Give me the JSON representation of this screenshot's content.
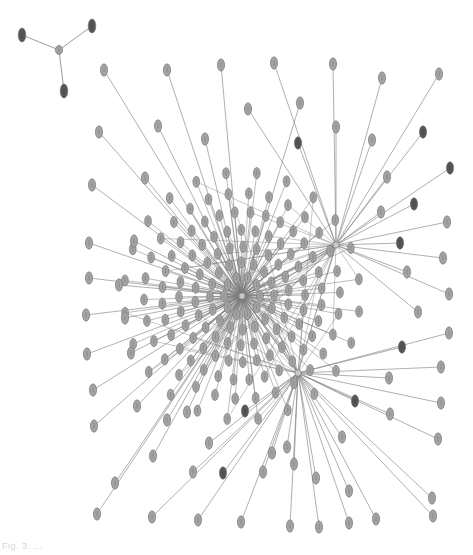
{
  "figure": {
    "type": "network-graph",
    "caption": "Fig. 3.  ..."
  },
  "colors": {
    "background": "#ffffff",
    "edge": "#7a7a7a",
    "node_light": "#a3a3a3",
    "node_dark": "#555555",
    "node_stroke": "#6e6e6e",
    "hub": "#c8c8c8"
  },
  "hubs": [
    {
      "id": "hub-main",
      "x": 242,
      "y": 296
    },
    {
      "id": "hub-right",
      "x": 336,
      "y": 245
    },
    {
      "id": "hub-lower",
      "x": 298,
      "y": 373
    }
  ],
  "small_component": {
    "center": {
      "x": 59,
      "y": 50
    },
    "leaves": [
      {
        "x": 22,
        "y": 35,
        "dark": true
      },
      {
        "x": 92,
        "y": 26,
        "dark": true
      },
      {
        "x": 64,
        "y": 91,
        "dark": true
      }
    ]
  },
  "outer_nodes": [
    {
      "x": 104,
      "y": 70,
      "hub": 0
    },
    {
      "x": 167,
      "y": 70,
      "hub": 0
    },
    {
      "x": 221,
      "y": 65,
      "hub": 0
    },
    {
      "x": 274,
      "y": 63,
      "hub": 1
    },
    {
      "x": 333,
      "y": 64,
      "hub": 1
    },
    {
      "x": 439,
      "y": 74,
      "hub": 1
    },
    {
      "x": 382,
      "y": 78,
      "hub": 1
    },
    {
      "x": 248,
      "y": 109,
      "hub": 1
    },
    {
      "x": 300,
      "y": 103,
      "hub": 0
    },
    {
      "x": 336,
      "y": 127,
      "hub": 1
    },
    {
      "x": 298,
      "y": 143,
      "hub": 1,
      "dark": true
    },
    {
      "x": 372,
      "y": 140,
      "hub": 1
    },
    {
      "x": 423,
      "y": 132,
      "hub": 1,
      "dark": true
    },
    {
      "x": 99,
      "y": 132,
      "hub": 0
    },
    {
      "x": 158,
      "y": 126,
      "hub": 0
    },
    {
      "x": 205,
      "y": 139,
      "hub": 0
    },
    {
      "x": 450,
      "y": 168,
      "hub": 1,
      "dark": true
    },
    {
      "x": 387,
      "y": 177,
      "hub": 1
    },
    {
      "x": 414,
      "y": 204,
      "hub": 1,
      "dark": true
    },
    {
      "x": 381,
      "y": 212,
      "hub": 1
    },
    {
      "x": 92,
      "y": 185,
      "hub": 0
    },
    {
      "x": 145,
      "y": 178,
      "hub": 0
    },
    {
      "x": 447,
      "y": 222,
      "hub": 1
    },
    {
      "x": 400,
      "y": 243,
      "hub": 1,
      "dark": true
    },
    {
      "x": 443,
      "y": 258,
      "hub": 1
    },
    {
      "x": 407,
      "y": 272,
      "hub": 1
    },
    {
      "x": 89,
      "y": 243,
      "hub": 0
    },
    {
      "x": 134,
      "y": 241,
      "hub": 0
    },
    {
      "x": 449,
      "y": 294,
      "hub": 1
    },
    {
      "x": 418,
      "y": 312,
      "hub": 1
    },
    {
      "x": 449,
      "y": 333,
      "hub": 2
    },
    {
      "x": 402,
      "y": 347,
      "hub": 2,
      "dark": true
    },
    {
      "x": 89,
      "y": 278,
      "hub": 0
    },
    {
      "x": 119,
      "y": 285,
      "hub": 0
    },
    {
      "x": 86,
      "y": 315,
      "hub": 0
    },
    {
      "x": 125,
      "y": 318,
      "hub": 0
    },
    {
      "x": 441,
      "y": 367,
      "hub": 2
    },
    {
      "x": 441,
      "y": 403,
      "hub": 2
    },
    {
      "x": 87,
      "y": 354,
      "hub": 0
    },
    {
      "x": 131,
      "y": 353,
      "hub": 0
    },
    {
      "x": 389,
      "y": 378,
      "hub": 2
    },
    {
      "x": 355,
      "y": 401,
      "hub": 2,
      "dark": true
    },
    {
      "x": 93,
      "y": 390,
      "hub": 0
    },
    {
      "x": 438,
      "y": 439,
      "hub": 2
    },
    {
      "x": 390,
      "y": 414,
      "hub": 2
    },
    {
      "x": 137,
      "y": 406,
      "hub": 0
    },
    {
      "x": 94,
      "y": 426,
      "hub": 0
    },
    {
      "x": 167,
      "y": 420,
      "hub": 0
    },
    {
      "x": 245,
      "y": 411,
      "hub": 2,
      "dark": true
    },
    {
      "x": 187,
      "y": 412,
      "hub": 0
    },
    {
      "x": 342,
      "y": 437,
      "hub": 2
    },
    {
      "x": 287,
      "y": 447,
      "hub": 2
    },
    {
      "x": 209,
      "y": 443,
      "hub": 2
    },
    {
      "x": 153,
      "y": 456,
      "hub": 0
    },
    {
      "x": 272,
      "y": 453,
      "hub": 2
    },
    {
      "x": 294,
      "y": 464,
      "hub": 2
    },
    {
      "x": 223,
      "y": 473,
      "hub": 2,
      "dark": true
    },
    {
      "x": 115,
      "y": 483,
      "hub": 0
    },
    {
      "x": 349,
      "y": 491,
      "hub": 2
    },
    {
      "x": 263,
      "y": 472,
      "hub": 2
    },
    {
      "x": 193,
      "y": 472,
      "hub": 2
    },
    {
      "x": 316,
      "y": 478,
      "hub": 2
    },
    {
      "x": 432,
      "y": 498,
      "hub": 2
    },
    {
      "x": 376,
      "y": 519,
      "hub": 2
    },
    {
      "x": 97,
      "y": 514,
      "hub": 0
    },
    {
      "x": 152,
      "y": 517,
      "hub": 2
    },
    {
      "x": 198,
      "y": 520,
      "hub": 2
    },
    {
      "x": 241,
      "y": 522,
      "hub": 2
    },
    {
      "x": 290,
      "y": 526,
      "hub": 2
    },
    {
      "x": 319,
      "y": 527,
      "hub": 2
    },
    {
      "x": 433,
      "y": 516,
      "hub": 2
    },
    {
      "x": 349,
      "y": 523,
      "hub": 2
    }
  ],
  "cluster": {
    "center_hub": 0,
    "rings": [
      {
        "radius": 18,
        "count": 10
      },
      {
        "radius": 32,
        "count": 16
      },
      {
        "radius": 47,
        "count": 22
      },
      {
        "radius": 63,
        "count": 28
      },
      {
        "radius": 80,
        "count": 32
      },
      {
        "radius": 98,
        "count": 30
      },
      {
        "radius": 118,
        "count": 24
      }
    ]
  }
}
